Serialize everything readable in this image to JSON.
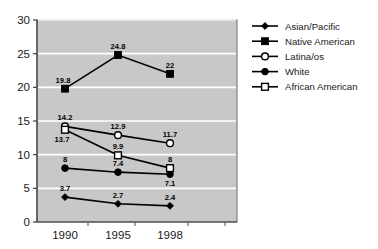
{
  "chart_data": {
    "type": "line",
    "title": "",
    "subtitle": "",
    "xlabel": "",
    "ylabel": "",
    "categories": [
      "1990",
      "1995",
      "1998"
    ],
    "x_tick_labels": [
      "1990",
      "1995",
      "1998"
    ],
    "y_tick_labels": [
      "0",
      "5",
      "10",
      "15",
      "20",
      "25",
      "30"
    ],
    "y_ticks": [
      0,
      5,
      10,
      15,
      20,
      25,
      30
    ],
    "ylim": [
      0,
      30
    ],
    "grid": "horizontal-white-gridlines",
    "plot_background": "#c8c8c8",
    "legend_position": "right",
    "series": [
      {
        "name": "Asian/Pacific",
        "marker": "filled-diamond-small",
        "color": "#000000",
        "values": [
          3.7,
          2.7,
          2.4
        ],
        "labels": [
          "3.7",
          "2.7",
          "2.4"
        ],
        "label_positions": [
          "above",
          "above",
          "above"
        ]
      },
      {
        "name": "Native American",
        "marker": "filled-square",
        "color": "#000000",
        "values": [
          19.8,
          24.8,
          22
        ],
        "labels": [
          "19.8",
          "24.8",
          "22"
        ],
        "label_positions": [
          "above-left",
          "above",
          "above"
        ]
      },
      {
        "name": "Latina/os",
        "marker": "open-circle",
        "color": "#000000",
        "values": [
          14.2,
          12.9,
          11.7
        ],
        "labels": [
          "14.2",
          "12.9",
          "11.7"
        ],
        "label_positions": [
          "above",
          "above",
          "above"
        ]
      },
      {
        "name": "White",
        "marker": "filled-circle",
        "color": "#000000",
        "values": [
          8,
          7.4,
          7.1
        ],
        "labels": [
          "8",
          "7.4",
          "7.1"
        ],
        "label_positions": [
          "above",
          "above",
          "below"
        ]
      },
      {
        "name": "African American",
        "marker": "open-square",
        "color": "#000000",
        "values": [
          13.7,
          9.9,
          8
        ],
        "labels": [
          "13.7",
          "9.9",
          "8"
        ],
        "label_positions": [
          "below-left",
          "above",
          "above"
        ]
      }
    ]
  },
  "legend": {
    "entries": [
      {
        "label": "Asian/Pacific",
        "marker": "filled-diamond-small"
      },
      {
        "label": "Native American",
        "marker": "filled-square"
      },
      {
        "label": "Latina/os",
        "marker": "open-circle"
      },
      {
        "label": "White",
        "marker": "filled-circle"
      },
      {
        "label": "African American",
        "marker": "open-square"
      }
    ]
  },
  "axis": {
    "y_labels": [
      "30",
      "25",
      "20",
      "15",
      "10",
      "5",
      "0"
    ],
    "x_labels": [
      "1990",
      "1995",
      "1998"
    ]
  }
}
